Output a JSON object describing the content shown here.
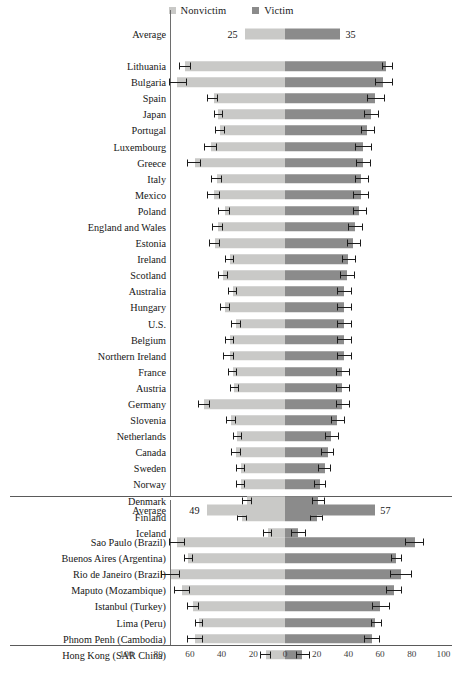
{
  "legend": {
    "items": [
      {
        "label": "Nonvictim",
        "color": "#c9c9c7",
        "key": "nonvictim"
      },
      {
        "label": "Victim",
        "color": "#8b8b8b",
        "key": "victim"
      }
    ]
  },
  "axis": {
    "ticks": [
      "100",
      "80",
      "60",
      "40",
      "20",
      "0",
      "20",
      "40",
      "60",
      "80",
      "100"
    ],
    "tick_values": [
      -100,
      -80,
      -60,
      -40,
      -20,
      0,
      20,
      40,
      60,
      80,
      100
    ],
    "min": -100,
    "max": 100
  },
  "chart_data": {
    "type": "bar",
    "title": "",
    "subtitle": "",
    "xlabel": "",
    "ylabel": "",
    "orientation": "horizontal",
    "layout": "diverging-paired-bars",
    "xlim": [
      -100,
      100
    ],
    "grid": false,
    "legend_position": "top-center",
    "series": [
      {
        "name": "Nonvictim",
        "color": "#c9c9c7",
        "side": "left"
      },
      {
        "name": "Victim",
        "color": "#8b8b8b",
        "side": "right"
      }
    ],
    "panels": [
      {
        "name": "countries",
        "average": {
          "label": "Average",
          "nonvictim": 25,
          "victim": 35,
          "nonvictim_label": "25",
          "victim_label": "35",
          "show_error_bars": false
        },
        "categories": [
          "Lithuania",
          "Bulgaria",
          "Spain",
          "Japan",
          "Portugal",
          "Luxembourg",
          "Greece",
          "Italy",
          "Mexico",
          "Poland",
          "England and Wales",
          "Estonia",
          "Ireland",
          "Scotland",
          "Australia",
          "Hungary",
          "U.S.",
          "Belgium",
          "Northern Ireland",
          "France",
          "Austria",
          "Germany",
          "Slovenia",
          "Netherlands",
          "Canada",
          "Sweden",
          "Norway",
          "Denmark",
          "Finland",
          "Iceland"
        ],
        "nonvictim": [
          63,
          68,
          45,
          42,
          41,
          47,
          57,
          43,
          45,
          38,
          42,
          44,
          35,
          39,
          33,
          38,
          31,
          35,
          35,
          33,
          32,
          51,
          34,
          30,
          31,
          28,
          28,
          24,
          27,
          11
        ],
        "victim": [
          64,
          62,
          57,
          54,
          52,
          49,
          49,
          48,
          48,
          47,
          44,
          43,
          40,
          39,
          37,
          37,
          37,
          37,
          37,
          36,
          36,
          36,
          33,
          29,
          27,
          25,
          22,
          21,
          20,
          8
        ],
        "nonvictim_err": [
          [
            59,
            67
          ],
          [
            62,
            73
          ],
          [
            42,
            49
          ],
          [
            39,
            45
          ],
          [
            38,
            44
          ],
          [
            43,
            51
          ],
          [
            53,
            62
          ],
          [
            40,
            47
          ],
          [
            41,
            49
          ],
          [
            35,
            42
          ],
          [
            39,
            46
          ],
          [
            41,
            48
          ],
          [
            32,
            38
          ],
          [
            36,
            42
          ],
          [
            30,
            36
          ],
          [
            35,
            41
          ],
          [
            28,
            34
          ],
          [
            32,
            38
          ],
          [
            32,
            39
          ],
          [
            30,
            36
          ],
          [
            29,
            35
          ],
          [
            47,
            55
          ],
          [
            31,
            37
          ],
          [
            27,
            33
          ],
          [
            28,
            34
          ],
          [
            25,
            31
          ],
          [
            25,
            31
          ],
          [
            21,
            27
          ],
          [
            24,
            30
          ],
          [
            8,
            14
          ]
        ],
        "victim_err": [
          [
            61,
            68
          ],
          [
            57,
            68
          ],
          [
            52,
            63
          ],
          [
            50,
            59
          ],
          [
            48,
            57
          ],
          [
            44,
            55
          ],
          [
            45,
            54
          ],
          [
            44,
            53
          ],
          [
            43,
            53
          ],
          [
            43,
            52
          ],
          [
            40,
            49
          ],
          [
            39,
            48
          ],
          [
            36,
            45
          ],
          [
            35,
            44
          ],
          [
            33,
            42
          ],
          [
            33,
            42
          ],
          [
            33,
            42
          ],
          [
            33,
            42
          ],
          [
            33,
            42
          ],
          [
            32,
            41
          ],
          [
            32,
            41
          ],
          [
            32,
            41
          ],
          [
            29,
            38
          ],
          [
            25,
            34
          ],
          [
            23,
            31
          ],
          [
            21,
            29
          ],
          [
            18,
            26
          ],
          [
            17,
            25
          ],
          [
            16,
            24
          ],
          [
            4,
            13
          ]
        ]
      },
      {
        "name": "cities",
        "average": {
          "label": "Average",
          "nonvictim": 49,
          "victim": 57,
          "nonvictim_label": "49",
          "victim_label": "57",
          "show_error_bars": false
        },
        "categories": [
          "Sao Paulo (Brazil)",
          "Buenos Aires (Argentina)",
          "Rio de Janeiro (Brazil)",
          "Maputo (Mozambique)",
          "Istanbul (Turkey)",
          "Lima (Peru)",
          "Phnom Penh (Cambodia)",
          "Hong Kong (SAR China)"
        ],
        "nonvictim": [
          68,
          61,
          72,
          65,
          58,
          54,
          57,
          12
        ],
        "victim": [
          82,
          70,
          73,
          69,
          60,
          57,
          55,
          11
        ],
        "nonvictim_err": [
          [
            63,
            73
          ],
          [
            58,
            64
          ],
          [
            66,
            78
          ],
          [
            60,
            70
          ],
          [
            54,
            62
          ],
          [
            52,
            57
          ],
          [
            52,
            62
          ],
          [
            9,
            16
          ]
        ],
        "victim_err": [
          [
            76,
            88
          ],
          [
            67,
            74
          ],
          [
            66,
            80
          ],
          [
            64,
            74
          ],
          [
            55,
            66
          ],
          [
            54,
            61
          ],
          [
            50,
            60
          ],
          [
            7,
            16
          ]
        ]
      }
    ]
  }
}
